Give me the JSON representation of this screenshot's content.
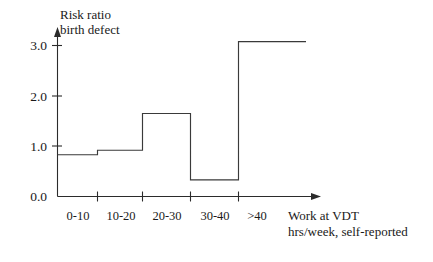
{
  "chart_data": {
    "type": "bar",
    "title": "",
    "ylabel": "Risk ratio\nbirth defect",
    "ylabel_line1": "Risk ratio",
    "ylabel_line2": "birth defect",
    "xlabel": "Work at VDT\nhrs/week, self-reported",
    "xlabel_line1": "Work at VDT",
    "xlabel_line2": "hrs/week, self-reported",
    "categories": [
      "0-10",
      "10-20",
      "20-30",
      "30-40",
      ">40"
    ],
    "values": [
      0.83,
      0.92,
      1.65,
      0.33,
      3.08
    ],
    "ylim": [
      0.0,
      3.3
    ],
    "yticks": [
      "0.0",
      "1.0",
      "2.0",
      "3.0"
    ],
    "ytick_values": [
      0.0,
      1.0,
      2.0,
      3.0
    ],
    "grid": false,
    "legend": "none",
    "style": "step",
    "line_color": "#3a3a3a",
    "axis_color": "#2b2b2b",
    "background_color": "#ffffff"
  },
  "axes": {
    "y_label_line1": "Risk ratio",
    "y_label_line2": "birth defect",
    "x_title_line1": "Work at VDT",
    "x_title_line2": "hrs/week, self-reported"
  },
  "ytick_labels": [
    "3.0",
    "2.0",
    "1.0",
    "0.0"
  ],
  "xtick_labels": [
    "0-10",
    "10-20",
    "20-30",
    "30-40",
    ">40"
  ]
}
